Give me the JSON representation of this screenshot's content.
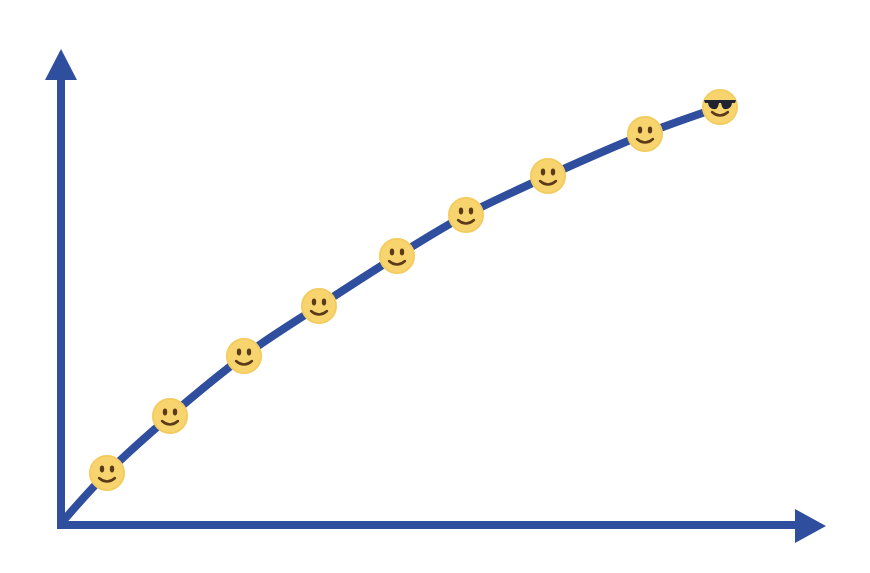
{
  "chart_data": {
    "type": "line",
    "title": "",
    "xlabel": "",
    "ylabel": "",
    "grid": false,
    "legend": null,
    "tick_labels": {
      "x": [],
      "y": []
    },
    "x": [
      0,
      1,
      2,
      3,
      4,
      5,
      6,
      7,
      8,
      9
    ],
    "values": [
      0,
      0.11,
      0.25,
      0.39,
      0.51,
      0.63,
      0.74,
      0.82,
      0.92,
      0.98
    ],
    "xlim": [
      0,
      10
    ],
    "ylim": [
      0,
      1.1
    ],
    "markers": [
      {
        "type": "smiley",
        "icon": "slightly-smiling-face"
      },
      {
        "type": "smiley",
        "icon": "slightly-smiling-face"
      },
      {
        "type": "smiley",
        "icon": "slightly-smiling-face"
      },
      {
        "type": "smiley",
        "icon": "slightly-smiling-face"
      },
      {
        "type": "smiley",
        "icon": "slightly-smiling-face"
      },
      {
        "type": "smiley",
        "icon": "slightly-smiling-face"
      },
      {
        "type": "smiley",
        "icon": "slightly-smiling-face"
      },
      {
        "type": "smiley",
        "icon": "slightly-smiling-face"
      },
      {
        "type": "smiley-sunglasses",
        "icon": "smiling-face-with-sunglasses"
      }
    ]
  },
  "render": {
    "colors": {
      "axis": "#2f4f9e",
      "curve": "#2f4f9e",
      "face": "#f7d46e",
      "face_shade": "#f1c453",
      "features": "#5b3a1a",
      "sunglasses": "#1f2430"
    },
    "origin": [
      61,
      525
    ],
    "y_axis_tip": [
      61,
      49
    ],
    "x_axis_tip": [
      826,
      526
    ],
    "curve_points": [
      [
        62,
        522
      ],
      [
        107,
        473
      ],
      [
        170,
        416
      ],
      [
        244,
        356
      ],
      [
        319,
        306
      ],
      [
        397,
        256
      ],
      [
        466,
        215
      ],
      [
        548,
        176
      ],
      [
        645,
        134
      ],
      [
        720,
        107
      ]
    ],
    "smileys": [
      {
        "cx": 107,
        "cy": 473,
        "kind": "smile"
      },
      {
        "cx": 170,
        "cy": 416,
        "kind": "smile"
      },
      {
        "cx": 244,
        "cy": 356,
        "kind": "smile"
      },
      {
        "cx": 319,
        "cy": 306,
        "kind": "smile"
      },
      {
        "cx": 397,
        "cy": 256,
        "kind": "smile"
      },
      {
        "cx": 466,
        "cy": 215,
        "kind": "smile"
      },
      {
        "cx": 548,
        "cy": 176,
        "kind": "smile"
      },
      {
        "cx": 645,
        "cy": 134,
        "kind": "smile"
      },
      {
        "cx": 720,
        "cy": 107,
        "kind": "sunglasses"
      }
    ],
    "marker_radius": 18
  }
}
